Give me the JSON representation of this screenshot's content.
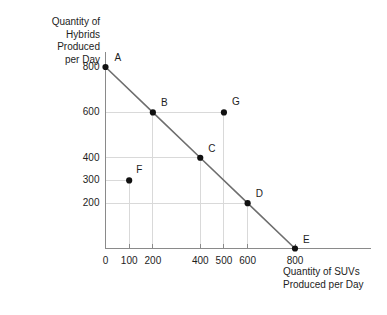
{
  "chart_data": {
    "type": "line",
    "title": "",
    "subtitle": "",
    "xlabel": "Quantity of SUVs\nProduced per Day",
    "ylabel": "Quantity of\nHybrids\nProduced\nper Day",
    "xlim": [
      0,
      900
    ],
    "ylim": [
      0,
      850
    ],
    "xticks": [
      0,
      100,
      200,
      400,
      500,
      600,
      800
    ],
    "xtick_labels": [
      "0",
      "100",
      "200",
      "400",
      "500",
      "600",
      "800"
    ],
    "yticks": [
      200,
      300,
      400,
      600,
      800
    ],
    "ytick_labels": [
      "200",
      "300",
      "400",
      "600",
      "800"
    ],
    "grid": true,
    "legend": "none",
    "series": [
      {
        "name": "Production Possibilities Frontier",
        "color": "#6e6e6e",
        "x": [
          0,
          200,
          400,
          600,
          800
        ],
        "y": [
          800,
          600,
          400,
          200,
          0
        ]
      }
    ],
    "points": [
      {
        "label": "A",
        "x": 0,
        "y": 800,
        "on_frontier": true,
        "label_dx": 9,
        "label_dy": -9
      },
      {
        "label": "B",
        "x": 200,
        "y": 600,
        "on_frontier": true,
        "label_dx": 8,
        "label_dy": -9
      },
      {
        "label": "C",
        "x": 400,
        "y": 400,
        "on_frontier": true,
        "label_dx": 8,
        "label_dy": -9
      },
      {
        "label": "D",
        "x": 600,
        "y": 200,
        "on_frontier": true,
        "label_dx": 8,
        "label_dy": -9
      },
      {
        "label": "E",
        "x": 800,
        "y": 0,
        "on_frontier": true,
        "label_dx": 8,
        "label_dy": -9
      },
      {
        "label": "F",
        "x": 100,
        "y": 300,
        "on_frontier": false,
        "label_dx": 7,
        "label_dy": -10
      },
      {
        "label": "G",
        "x": 500,
        "y": 600,
        "on_frontier": false,
        "label_dx": 8,
        "label_dy": -10
      }
    ],
    "gridlines_h": [
      {
        "y": 600,
        "x_to": 500
      },
      {
        "y": 400,
        "x_to": 400
      },
      {
        "y": 300,
        "x_to": 100
      },
      {
        "y": 200,
        "x_to": 600
      }
    ],
    "gridlines_v": [
      {
        "x": 100,
        "y_to": 300
      },
      {
        "x": 200,
        "y_to": 600
      },
      {
        "x": 400,
        "y_to": 400
      },
      {
        "x": 500,
        "y_to": 600
      },
      {
        "x": 600,
        "y_to": 200
      }
    ],
    "colors": {
      "axis": "#8a8a8a",
      "grid": "#d9d9d9",
      "line": "#6e6e6e",
      "marker": "#111111",
      "text": "#1d1d1d",
      "background": "#ffffff"
    }
  }
}
